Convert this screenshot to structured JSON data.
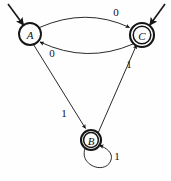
{
  "diagram": {
    "type": "finite-state-machine",
    "title": "",
    "canvas": {
      "width": 171,
      "height": 181,
      "background": "#fefefe"
    },
    "colors": {
      "stroke": "#151515",
      "fill": "#fdfdfd",
      "label": "#101010"
    },
    "states": [
      {
        "id": "A",
        "label": "A",
        "cx": 30,
        "cy": 34,
        "r": 11,
        "accepting": false,
        "start": true,
        "start_arrow": {
          "x1": 8,
          "y1": 4,
          "x2": 23.5,
          "y2": 25
        }
      },
      {
        "id": "C",
        "label": "C",
        "cx": 142,
        "cy": 35,
        "r": 12,
        "r_inner": 8.8,
        "accepting": true,
        "start": true,
        "start_arrow": {
          "x1": 165,
          "y1": 4,
          "x2": 149.5,
          "y2": 25
        }
      },
      {
        "id": "B",
        "label": "B",
        "cx": 91,
        "cy": 140,
        "r": 10,
        "r_inner": 7.4,
        "accepting": true,
        "start": false
      }
    ],
    "transitions": [
      {
        "id": "a-to-c",
        "from": "A",
        "to": "C",
        "symbol": "0",
        "shape": "arc-top",
        "label_x": 116,
        "label_y": 12
      },
      {
        "id": "c-to-a",
        "from": "C",
        "to": "A",
        "symbol": "0",
        "shape": "arc-bottom",
        "label_x": 52,
        "label_y": 53
      },
      {
        "id": "a-to-b",
        "from": "A",
        "to": "B",
        "symbol": "1",
        "shape": "line",
        "label_x": 64,
        "label_y": 113
      },
      {
        "id": "b-to-c",
        "from": "B",
        "to": "C",
        "symbol": "1",
        "shape": "line",
        "label_x": 129,
        "label_y": 64
      },
      {
        "id": "b-to-b",
        "from": "B",
        "to": "B",
        "symbol": "1",
        "shape": "self-loop",
        "label_x": 117,
        "label_y": 156
      }
    ]
  }
}
